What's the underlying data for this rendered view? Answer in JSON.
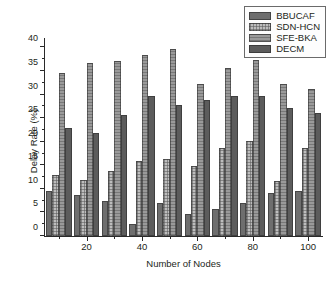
{
  "chart_data": {
    "type": "bar",
    "title": "",
    "xlabel": "Number of Nodes",
    "ylabel": "Delay Rate (%)",
    "categories": [
      "10",
      "20",
      "30",
      "40",
      "50",
      "60",
      "70",
      "80",
      "90",
      "100"
    ],
    "xlim": [
      5,
      105
    ],
    "ylim": [
      0,
      42
    ],
    "ytick_labels": [
      "0",
      "5",
      "10",
      "15",
      "20",
      "25",
      "30",
      "35",
      "40"
    ],
    "ytick_values": [
      0,
      5,
      10,
      15,
      20,
      25,
      30,
      35,
      40
    ],
    "xtick_labels": [
      "20",
      "40",
      "60",
      "80",
      "100"
    ],
    "xtick_values": [
      20,
      40,
      60,
      80,
      100
    ],
    "xtick_minor_values": [
      10,
      30,
      50,
      70,
      90
    ],
    "grid": false,
    "legend_position": "top-right",
    "series": [
      {
        "name": "BBUCAF",
        "color": "#6e6e6e",
        "values": [
          9.6,
          8.7,
          7.4,
          2.5,
          6.9,
          4.7,
          5.7,
          7.0,
          9.2,
          9.6
        ]
      },
      {
        "name": "SDN-HCN",
        "color": "#bdbdbd",
        "values": [
          12.9,
          11.8,
          13.7,
          15.9,
          16.4,
          14.9,
          18.6,
          20.1,
          11.7,
          18.6
        ]
      },
      {
        "name": "SFE-BKA",
        "color": "#9a9a9a",
        "values": [
          34.6,
          36.8,
          37.1,
          38.5,
          39.6,
          32.2,
          35.6,
          37.4,
          32.2,
          31.1
        ]
      },
      {
        "name": "DECM",
        "color": "#5c5c5c",
        "values": [
          22.9,
          21.9,
          25.7,
          29.7,
          27.8,
          28.9,
          29.7,
          29.6,
          27.2,
          26.2
        ]
      }
    ]
  },
  "legend": {
    "items": [
      {
        "label": "BBUCAF"
      },
      {
        "label": "SDN-HCN"
      },
      {
        "label": "SFE-BKA"
      },
      {
        "label": "DECM"
      }
    ]
  }
}
